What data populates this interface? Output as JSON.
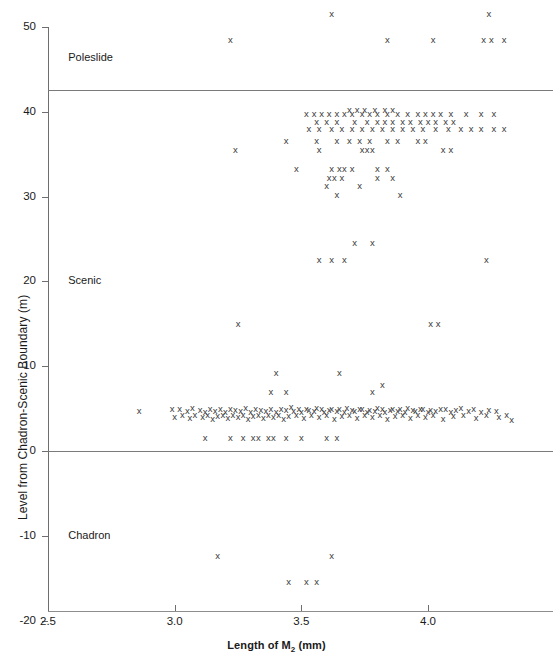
{
  "chart_data": {
    "type": "scatter",
    "title": "",
    "xlabel": "Length of M2 (mm)",
    "xlabel_parts": {
      "pre": "Length of M",
      "sub": "2",
      "post": " (mm)"
    },
    "ylabel": "Level from Chadron-Scenic Boundary (m)",
    "xlim": [
      2.5,
      4.35
    ],
    "ylim": [
      -20,
      51.8
    ],
    "xticks": [
      2.5,
      3.0,
      3.5,
      4.0
    ],
    "xtick_labels": [
      "2.5",
      "3.0",
      "3.5",
      "4.0"
    ],
    "yticks": [
      50,
      40,
      30,
      20,
      10,
      0,
      -10,
      -20
    ],
    "ytick_labels": [
      "50",
      "40",
      "30",
      "20",
      "10",
      "0",
      "-10",
      "-20"
    ],
    "grid": false,
    "legend": "none",
    "marker": "x",
    "marker_color": "#3a3a3a",
    "axis_color": "#6e6e6e",
    "reference_lines": [
      {
        "name": "poleslide-scenic-boundary",
        "y": 42.6,
        "color": "#7a7a7a"
      },
      {
        "name": "chadron-scenic-boundary",
        "y": 0.0,
        "color": "#7a7a7a"
      }
    ],
    "formation_labels": [
      {
        "name": "Poleslide",
        "x": 2.58,
        "y": 46.3
      },
      {
        "name": "Scenic",
        "x": 2.58,
        "y": 20.0
      },
      {
        "name": "Chadron",
        "x": 2.58,
        "y": -10.0
      }
    ],
    "points": [
      [
        3.62,
        51.5
      ],
      [
        4.24,
        51.5
      ],
      [
        3.22,
        48.5
      ],
      [
        3.84,
        48.5
      ],
      [
        4.02,
        48.5
      ],
      [
        4.22,
        48.5
      ],
      [
        4.25,
        48.5
      ],
      [
        4.3,
        48.5
      ],
      [
        3.69,
        40.2
      ],
      [
        3.72,
        40.2
      ],
      [
        3.75,
        40.2
      ],
      [
        3.79,
        40.2
      ],
      [
        3.83,
        40.2
      ],
      [
        3.86,
        40.2
      ],
      [
        3.52,
        39.7
      ],
      [
        3.55,
        39.7
      ],
      [
        3.58,
        39.7
      ],
      [
        3.61,
        39.7
      ],
      [
        3.64,
        39.7
      ],
      [
        3.67,
        39.7
      ],
      [
        3.7,
        39.7
      ],
      [
        3.74,
        39.7
      ],
      [
        3.77,
        39.7
      ],
      [
        3.8,
        39.7
      ],
      [
        3.84,
        39.7
      ],
      [
        3.88,
        39.7
      ],
      [
        3.92,
        39.7
      ],
      [
        3.96,
        39.7
      ],
      [
        3.99,
        39.7
      ],
      [
        4.02,
        39.7
      ],
      [
        4.05,
        39.7
      ],
      [
        4.09,
        39.7
      ],
      [
        4.15,
        39.7
      ],
      [
        4.21,
        39.7
      ],
      [
        4.26,
        39.7
      ],
      [
        3.56,
        38.8
      ],
      [
        3.6,
        38.8
      ],
      [
        3.64,
        38.8
      ],
      [
        3.71,
        38.8
      ],
      [
        3.76,
        38.8
      ],
      [
        3.8,
        38.8
      ],
      [
        3.83,
        38.8
      ],
      [
        3.86,
        38.8
      ],
      [
        3.9,
        38.8
      ],
      [
        3.93,
        38.8
      ],
      [
        3.97,
        38.8
      ],
      [
        4.0,
        38.8
      ],
      [
        4.03,
        38.8
      ],
      [
        4.07,
        38.8
      ],
      [
        4.1,
        38.8
      ],
      [
        3.53,
        38.0
      ],
      [
        3.57,
        38.0
      ],
      [
        3.62,
        38.0
      ],
      [
        3.66,
        38.0
      ],
      [
        3.7,
        38.0
      ],
      [
        3.74,
        38.0
      ],
      [
        3.78,
        38.0
      ],
      [
        3.82,
        38.0
      ],
      [
        3.86,
        38.0
      ],
      [
        3.9,
        38.0
      ],
      [
        3.94,
        38.0
      ],
      [
        3.98,
        38.0
      ],
      [
        4.03,
        38.0
      ],
      [
        4.08,
        38.0
      ],
      [
        4.13,
        38.0
      ],
      [
        4.17,
        38.0
      ],
      [
        4.21,
        38.0
      ],
      [
        4.26,
        38.0
      ],
      [
        4.3,
        38.0
      ],
      [
        3.44,
        36.6
      ],
      [
        3.56,
        36.6
      ],
      [
        3.64,
        36.6
      ],
      [
        3.69,
        36.6
      ],
      [
        3.73,
        36.6
      ],
      [
        3.77,
        36.6
      ],
      [
        3.84,
        36.6
      ],
      [
        3.88,
        36.6
      ],
      [
        3.96,
        36.6
      ],
      [
        3.99,
        36.6
      ],
      [
        3.24,
        35.5
      ],
      [
        3.57,
        35.5
      ],
      [
        3.74,
        35.5
      ],
      [
        3.76,
        35.5
      ],
      [
        3.78,
        35.5
      ],
      [
        4.06,
        35.5
      ],
      [
        4.09,
        35.5
      ],
      [
        3.48,
        33.2
      ],
      [
        3.62,
        33.2
      ],
      [
        3.65,
        33.2
      ],
      [
        3.67,
        33.2
      ],
      [
        3.7,
        33.2
      ],
      [
        3.8,
        33.2
      ],
      [
        3.84,
        33.2
      ],
      [
        3.61,
        32.2
      ],
      [
        3.63,
        32.2
      ],
      [
        3.66,
        32.2
      ],
      [
        3.8,
        32.2
      ],
      [
        3.86,
        32.2
      ],
      [
        3.6,
        31.2
      ],
      [
        3.73,
        31.2
      ],
      [
        3.64,
        30.2
      ],
      [
        3.89,
        30.2
      ],
      [
        3.71,
        24.5
      ],
      [
        3.78,
        24.5
      ],
      [
        3.57,
        22.5
      ],
      [
        3.62,
        22.5
      ],
      [
        3.67,
        22.5
      ],
      [
        4.23,
        22.5
      ],
      [
        3.25,
        15.0
      ],
      [
        4.01,
        15.0
      ],
      [
        4.04,
        15.0
      ],
      [
        3.4,
        9.2
      ],
      [
        3.65,
        9.2
      ],
      [
        3.82,
        7.8
      ],
      [
        3.38,
        6.9
      ],
      [
        3.44,
        6.9
      ],
      [
        3.78,
        6.9
      ],
      [
        2.86,
        4.7
      ],
      [
        2.99,
        4.9
      ],
      [
        3.02,
        4.9
      ],
      [
        3.05,
        4.7
      ],
      [
        3.07,
        5.1
      ],
      [
        3.1,
        4.8
      ],
      [
        3.12,
        4.6
      ],
      [
        3.14,
        5.0
      ],
      [
        3.16,
        4.7
      ],
      [
        3.18,
        4.9
      ],
      [
        3.2,
        4.6
      ],
      [
        3.22,
        5.0
      ],
      [
        3.24,
        4.8
      ],
      [
        3.26,
        4.7
      ],
      [
        3.28,
        5.1
      ],
      [
        3.3,
        4.6
      ],
      [
        3.32,
        4.9
      ],
      [
        3.34,
        4.8
      ],
      [
        3.36,
        4.7
      ],
      [
        3.38,
        5.0
      ],
      [
        3.4,
        4.6
      ],
      [
        3.42,
        4.9
      ],
      [
        3.44,
        4.8
      ],
      [
        3.46,
        5.2
      ],
      [
        3.47,
        4.7
      ],
      [
        3.49,
        4.9
      ],
      [
        3.5,
        4.6
      ],
      [
        3.52,
        5.0
      ],
      [
        3.53,
        4.8
      ],
      [
        3.55,
        4.7
      ],
      [
        3.56,
        5.1
      ],
      [
        3.58,
        4.9
      ],
      [
        3.59,
        4.6
      ],
      [
        3.61,
        4.8
      ],
      [
        3.62,
        5.0
      ],
      [
        3.64,
        4.7
      ],
      [
        3.65,
        4.9
      ],
      [
        3.67,
        4.6
      ],
      [
        3.68,
        5.1
      ],
      [
        3.7,
        4.8
      ],
      [
        3.71,
        4.7
      ],
      [
        3.73,
        4.9
      ],
      [
        3.74,
        5.0
      ],
      [
        3.76,
        4.6
      ],
      [
        3.77,
        4.8
      ],
      [
        3.79,
        4.7
      ],
      [
        3.8,
        5.1
      ],
      [
        3.82,
        4.9
      ],
      [
        3.83,
        4.6
      ],
      [
        3.85,
        4.8
      ],
      [
        3.86,
        5.0
      ],
      [
        3.88,
        4.7
      ],
      [
        3.89,
        4.9
      ],
      [
        3.91,
        4.6
      ],
      [
        3.92,
        5.1
      ],
      [
        3.94,
        4.8
      ],
      [
        3.95,
        4.7
      ],
      [
        3.97,
        4.9
      ],
      [
        3.98,
        5.0
      ],
      [
        4.0,
        4.6
      ],
      [
        4.01,
        4.8
      ],
      [
        4.03,
        4.7
      ],
      [
        4.05,
        5.0
      ],
      [
        4.07,
        4.9
      ],
      [
        4.09,
        4.6
      ],
      [
        4.11,
        4.8
      ],
      [
        4.13,
        5.1
      ],
      [
        4.16,
        4.7
      ],
      [
        4.18,
        4.9
      ],
      [
        4.21,
        4.6
      ],
      [
        4.24,
        4.8
      ],
      [
        4.27,
        4.7
      ],
      [
        4.31,
        4.3
      ],
      [
        3.0,
        4.0
      ],
      [
        3.03,
        4.2
      ],
      [
        3.06,
        3.9
      ],
      [
        3.08,
        4.3
      ],
      [
        3.11,
        4.0
      ],
      [
        3.13,
        4.2
      ],
      [
        3.15,
        3.8
      ],
      [
        3.17,
        4.1
      ],
      [
        3.19,
        4.3
      ],
      [
        3.21,
        3.9
      ],
      [
        3.23,
        4.2
      ],
      [
        3.25,
        4.0
      ],
      [
        3.27,
        4.3
      ],
      [
        3.29,
        3.8
      ],
      [
        3.31,
        4.1
      ],
      [
        3.33,
        4.2
      ],
      [
        3.35,
        3.9
      ],
      [
        3.37,
        4.3
      ],
      [
        3.39,
        4.0
      ],
      [
        3.41,
        4.2
      ],
      [
        3.43,
        3.8
      ],
      [
        3.45,
        4.1
      ],
      [
        3.48,
        4.3
      ],
      [
        3.51,
        3.9
      ],
      [
        3.54,
        4.2
      ],
      [
        3.57,
        4.0
      ],
      [
        3.6,
        4.3
      ],
      [
        3.63,
        3.8
      ],
      [
        3.66,
        4.1
      ],
      [
        3.69,
        4.2
      ],
      [
        3.72,
        3.9
      ],
      [
        3.75,
        4.3
      ],
      [
        3.78,
        4.0
      ],
      [
        3.81,
        4.2
      ],
      [
        3.84,
        3.8
      ],
      [
        3.87,
        4.1
      ],
      [
        3.9,
        4.3
      ],
      [
        3.93,
        3.9
      ],
      [
        3.96,
        4.2
      ],
      [
        3.99,
        4.0
      ],
      [
        4.02,
        4.3
      ],
      [
        4.06,
        3.8
      ],
      [
        4.1,
        4.1
      ],
      [
        4.14,
        4.2
      ],
      [
        4.19,
        3.9
      ],
      [
        4.23,
        4.2
      ],
      [
        4.28,
        4.0
      ],
      [
        4.33,
        3.6
      ],
      [
        3.12,
        1.5
      ],
      [
        3.22,
        1.5
      ],
      [
        3.27,
        1.5
      ],
      [
        3.31,
        1.5
      ],
      [
        3.33,
        1.5
      ],
      [
        3.37,
        1.5
      ],
      [
        3.39,
        1.5
      ],
      [
        3.44,
        1.5
      ],
      [
        3.5,
        1.5
      ],
      [
        3.6,
        1.5
      ],
      [
        3.64,
        1.5
      ],
      [
        3.17,
        -12.4
      ],
      [
        3.62,
        -12.4
      ],
      [
        3.45,
        -15.5
      ],
      [
        3.52,
        -15.5
      ],
      [
        3.56,
        -15.5
      ]
    ]
  }
}
